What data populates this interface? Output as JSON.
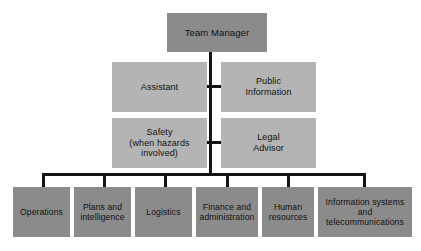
{
  "diagram": {
    "type": "organizational-chart",
    "canvas": {
      "width": 421,
      "height": 251
    },
    "background_color": "#ffffff",
    "colors": {
      "node_dark": "#8b8b8b",
      "node_light": "#b4b4b4",
      "connector": "#141414",
      "text": "#111111"
    }
  },
  "root": {
    "id": "team-manager",
    "label": "Team Manager",
    "fill": "#8b8b8b"
  },
  "staff": [
    {
      "id": "assistant",
      "label": "Assistant",
      "fill": "#b4b4b4",
      "side": "left",
      "row": 1
    },
    {
      "id": "public-information",
      "label": "Public\nInformation",
      "fill": "#b4b4b4",
      "side": "right",
      "row": 1
    },
    {
      "id": "safety",
      "label": "Safety\n(when hazards\ninvolved)",
      "fill": "#b4b4b4",
      "side": "left",
      "row": 2
    },
    {
      "id": "legal-advisor",
      "label": "Legal\nAdvisor",
      "fill": "#b4b4b4",
      "side": "right",
      "row": 2
    }
  ],
  "sections": [
    {
      "id": "operations",
      "label": "Operations",
      "fill": "#8b8b8b"
    },
    {
      "id": "plans-intelligence",
      "label": "Plans and\nintelligence",
      "fill": "#8b8b8b"
    },
    {
      "id": "logistics",
      "label": "Logistics",
      "fill": "#8b8b8b"
    },
    {
      "id": "finance-administration",
      "label": "Finance and\nadministration",
      "fill": "#8b8b8b"
    },
    {
      "id": "human-resources",
      "label": "Human\nresources",
      "fill": "#8b8b8b"
    },
    {
      "id": "information-systems",
      "label": "Information systems\nand\ntelecommunications",
      "fill": "#8b8b8b"
    }
  ]
}
